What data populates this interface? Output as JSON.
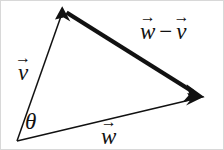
{
  "figure": {
    "background_color": "#ffffff",
    "stroke_color": "#111111",
    "border_color": "#d8d8d8",
    "width": 224,
    "height": 150
  },
  "labels": {
    "v": {
      "symbol": "v",
      "arrow": "→",
      "text": "v⃗"
    },
    "w": {
      "symbol": "w",
      "arrow": "→",
      "text": "w⃗"
    },
    "w_minus_v": {
      "first_symbol": "w",
      "operator": "−",
      "second_symbol": "v",
      "arrow": "→",
      "text": "w⃗ − v⃗"
    },
    "theta": {
      "symbol": "θ",
      "text": "θ"
    }
  },
  "geometry": {
    "origin": {
      "x": 16,
      "y": 140
    },
    "apex": {
      "x": 62,
      "y": 9
    },
    "right": {
      "x": 202,
      "y": 96
    },
    "edges": [
      {
        "name": "vector-v",
        "from": "origin",
        "to": "apex",
        "stroke_width": 1.4,
        "arrowhead": "at-end",
        "style": "thin"
      },
      {
        "name": "vector-w",
        "from": "origin",
        "to": "right",
        "stroke_width": 1.4,
        "arrowhead": "at-end",
        "style": "thin"
      },
      {
        "name": "vector-w-minus-v",
        "from": "apex",
        "to": "right",
        "stroke_width": 4.2,
        "arrowhead": "at-end",
        "style": "thick"
      }
    ],
    "angle_marker": {
      "name": "theta-angle",
      "at": "origin",
      "between": [
        "vector-v",
        "vector-w"
      ]
    }
  }
}
